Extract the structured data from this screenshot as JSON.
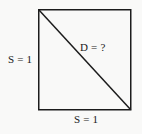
{
  "figure": {
    "name": "square-with-diagonal",
    "background_color": "#f9f9f8",
    "stroke_color": "#1c1c1c",
    "text_color": "#1a1a1a",
    "square": {
      "x": 38,
      "y": 9,
      "width": 93,
      "height": 101
    },
    "diagonal": {
      "x1": 38,
      "y1": 9,
      "x2": 131,
      "y2": 110
    },
    "labels": {
      "side_left": "S = 1",
      "side_bottom": "S = 1",
      "diagonal": "D = ?"
    }
  }
}
